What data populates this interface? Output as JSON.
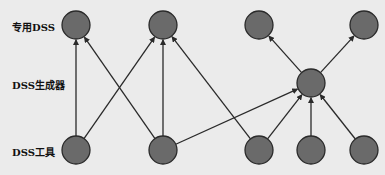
{
  "labels": {
    "top": "专用DSS",
    "middle": "DSS生成器",
    "bottom": "DSS工具"
  },
  "colors": {
    "node_fill": "#6a6a6a",
    "node_stroke": "#2a2a2a",
    "edge": "#2a2a2a",
    "background": "#ebebeb"
  },
  "nodes": [
    {
      "id": "top1",
      "layer": "专用DSS",
      "x": 76,
      "y": 25
    },
    {
      "id": "top2",
      "layer": "专用DSS",
      "x": 163,
      "y": 25
    },
    {
      "id": "top3",
      "layer": "专用DSS",
      "x": 259,
      "y": 25
    },
    {
      "id": "top4",
      "layer": "专用DSS",
      "x": 364,
      "y": 25
    },
    {
      "id": "mid1",
      "layer": "DSS生成器",
      "x": 311,
      "y": 83
    },
    {
      "id": "bot1",
      "layer": "DSS工具",
      "x": 76,
      "y": 150
    },
    {
      "id": "bot2",
      "layer": "DSS工具",
      "x": 163,
      "y": 150
    },
    {
      "id": "bot3",
      "layer": "DSS工具",
      "x": 259,
      "y": 150
    },
    {
      "id": "bot4",
      "layer": "DSS工具",
      "x": 311,
      "y": 150
    },
    {
      "id": "bot5",
      "layer": "DSS工具",
      "x": 364,
      "y": 150
    }
  ],
  "edges": [
    {
      "from": "bot1",
      "to": "top1"
    },
    {
      "from": "bot1",
      "to": "top2"
    },
    {
      "from": "bot2",
      "to": "top1"
    },
    {
      "from": "bot2",
      "to": "top2"
    },
    {
      "from": "bot2",
      "to": "mid1"
    },
    {
      "from": "bot3",
      "to": "top2"
    },
    {
      "from": "bot3",
      "to": "mid1"
    },
    {
      "from": "bot4",
      "to": "mid1"
    },
    {
      "from": "bot5",
      "to": "mid1"
    },
    {
      "from": "mid1",
      "to": "top3"
    },
    {
      "from": "mid1",
      "to": "top4"
    }
  ],
  "node_radius": 14
}
